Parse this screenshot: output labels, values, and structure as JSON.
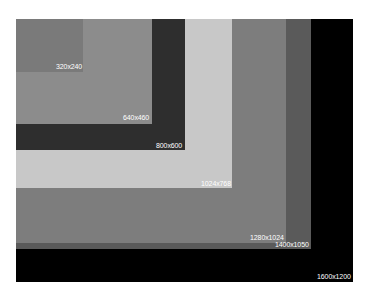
{
  "diagram": {
    "rectangles": [
      {
        "label": "1600x1200",
        "color": "#000000"
      },
      {
        "label": "1400x1050",
        "color": "#5a5a5a"
      },
      {
        "label": "1280x1024",
        "color": "#7d7d7d"
      },
      {
        "label": "1024x768",
        "color": "#c8c8c8"
      },
      {
        "label": "800x600",
        "color": "#2e2e2e"
      },
      {
        "label": "640x460",
        "color": "#8c8c8c"
      },
      {
        "label": "320x240",
        "color": "#7a7a7a"
      }
    ]
  }
}
